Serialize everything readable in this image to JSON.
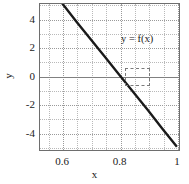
{
  "chart_data": {
    "type": "line",
    "title": "",
    "xlabel": "x",
    "ylabel": "y",
    "xlim": [
      0.52,
      1.01
    ],
    "ylim": [
      -5.3,
      5.1
    ],
    "grid": true,
    "legend_position": "inline-annotation",
    "x_ticks": [
      {
        "value": 0.6,
        "label": "0.6"
      },
      {
        "value": 0.8,
        "label": "0.8"
      },
      {
        "value": 1.0,
        "label": "1"
      }
    ],
    "y_ticks": [
      {
        "value": 4,
        "label": "4"
      },
      {
        "value": 2,
        "label": "2"
      },
      {
        "value": 0,
        "label": "0"
      },
      {
        "value": -2,
        "label": "-2"
      },
      {
        "value": -4,
        "label": "-4"
      }
    ],
    "x_minor_step": 0.05,
    "y_minor_step": 1,
    "series": [
      {
        "name": "y = f(x)",
        "x": [
          0.6,
          0.65,
          0.7,
          0.75,
          0.8,
          0.85,
          0.9,
          0.95,
          1.0
        ],
        "values": [
          5.1,
          3.8,
          2.55,
          1.3,
          0.05,
          -1.2,
          -2.45,
          -3.75,
          -5.0
        ],
        "color": "#1a1a1a",
        "style": "solid",
        "linewidth": 2.2
      }
    ],
    "annotations": [
      {
        "name": "curve-label",
        "text": "y = f(x)",
        "x": 0.805,
        "y": 2.55
      },
      {
        "name": "root-highlight-box",
        "type": "dashed-rect",
        "x_range": [
          0.8145,
          0.8965
        ],
        "y_range": [
          -0.55,
          0.6
        ]
      }
    ],
    "zero_line": {
      "value": 0,
      "color": "#808080"
    }
  },
  "axes": {
    "frame_color": "#6e6e6e",
    "grid_color": "#b9b9b9",
    "background": "#ffffff"
  }
}
